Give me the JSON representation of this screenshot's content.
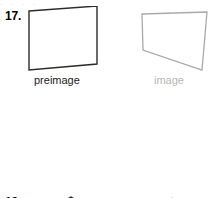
{
  "page": {
    "background_color": "#ffffff",
    "top_partial_text": "· · · ·"
  },
  "styles": {
    "dark_stroke": "#2b2b2b",
    "light_stroke": "#a9a9a9",
    "dark_text": "#1a1a1a",
    "light_text": "#b6b6b6"
  },
  "problems": [
    {
      "number": "17.",
      "preimage": {
        "caption": "preimage",
        "shape": "quadrilateral",
        "stroke": "#2b2b2b",
        "points": "4,5 72,0 72,58 4,64"
      },
      "image": {
        "caption": "image",
        "shape": "quadrilateral",
        "stroke": "#a9a9a9",
        "points": "8,8 73,6 68,64 9,44"
      }
    },
    {
      "number": "18.",
      "preimage": {
        "caption": "preimage",
        "shape": "pentagon",
        "stroke": "#2b2b2b",
        "points": "46,5 82,26 70,59 21,59 8,26"
      },
      "image": {
        "caption": "image",
        "shape": "pentagon",
        "stroke": "#a9a9a9",
        "points": "38,6 72,31 59,71 16,71 5,31"
      }
    }
  ]
}
